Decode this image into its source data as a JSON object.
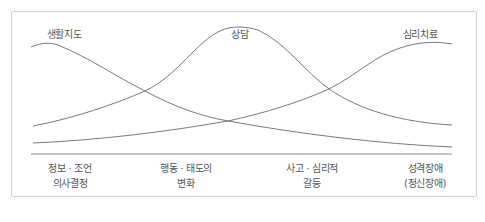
{
  "diagram": {
    "curves": [
      {
        "id": "guidance",
        "label": "생활지도",
        "label_x": 64,
        "label_y": 26,
        "path": "M31,47 C40,43 50,42 58,45 C90,58 115,76 145,91 C175,107 200,116 228,121 C300,134 380,144 452,147"
      },
      {
        "id": "counseling",
        "label": "상담",
        "label_x": 240,
        "label_y": 26,
        "path": "M33,126 C75,118 115,104 145,91 C180,74 195,42 222,30 C232,26 245,26 258,30 C285,42 305,72 329,89 C360,110 400,122 452,125"
      },
      {
        "id": "therapy",
        "label": "심리치료",
        "label_x": 420,
        "label_y": 26,
        "path": "M33,143 C100,140 165,132 228,121 C265,113 300,102 329,89 C358,74 375,56 400,48 C418,42 435,41 452,44"
      }
    ],
    "baseline": {
      "x1": 31,
      "x2": 452,
      "y": 154
    },
    "stroke_color": "#7a7a7a",
    "axis_labels": [
      {
        "line1": "정보 · 조언",
        "line2": "의사결정",
        "x": 70
      },
      {
        "line1": "행동 · 태도의",
        "line2": "변화",
        "x": 186
      },
      {
        "line1": "사고 · 심리적",
        "line2": "갈등",
        "x": 312
      },
      {
        "line1": "성격장애",
        "line2": "(정신장애)",
        "x": 425
      }
    ]
  }
}
